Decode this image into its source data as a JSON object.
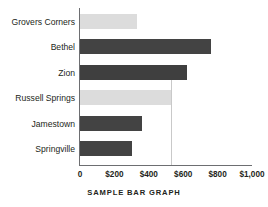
{
  "chart_data": {
    "type": "bar",
    "orientation": "horizontal",
    "title": "SAMPLE BAR GRAPH",
    "xlabel": "",
    "ylabel": "",
    "xlim": [
      0,
      1000
    ],
    "grid": false,
    "legend": "none",
    "categories": [
      "Grovers Corners",
      "Bethel",
      "Zion",
      "Russell Springs",
      "Jamestown",
      "Springville"
    ],
    "values": [
      330,
      760,
      620,
      530,
      360,
      300
    ],
    "bar_colors": [
      "#dcdcdc",
      "#434343",
      "#3f3f3f",
      "#dcdcdc",
      "#434343",
      "#434343"
    ],
    "xticks": [
      0,
      200,
      400,
      600,
      800,
      1000
    ],
    "xtick_labels": [
      "0",
      "$200",
      "$400",
      "$600",
      "$800",
      "$1,000"
    ],
    "bars": [
      {
        "label": "Grovers Corners",
        "value": 330,
        "color": "#dcdcdc",
        "shade": "light"
      },
      {
        "label": "Bethel",
        "value": 760,
        "color": "#434343",
        "shade": "dark"
      },
      {
        "label": "Zion",
        "value": 620,
        "color": "#3f3f3f",
        "shade": "dark"
      },
      {
        "label": "Russell Springs",
        "value": 530,
        "color": "#dcdcdc",
        "shade": "light"
      },
      {
        "label": "Jamestown",
        "value": 360,
        "color": "#434343",
        "shade": "dark"
      },
      {
        "label": "Springville",
        "value": 300,
        "color": "#434343",
        "shade": "dark"
      }
    ],
    "colors": {
      "light_bar": "#dcdcdc",
      "dark_bar": "#434343",
      "axis": "#6d6e71",
      "text": "#231f20",
      "rule": "#c9c9c9",
      "background": "#ffffff"
    },
    "annotations": {
      "value_rule_at": 530
    }
  }
}
